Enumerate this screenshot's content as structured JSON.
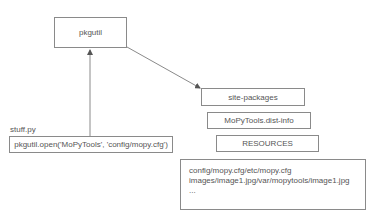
{
  "nodes": {
    "pkgutil": "pkgutil",
    "stuff_label": "stuff.py",
    "stuff_code": "pkgutil.open('MoPyTools', 'config/mopy.cfg')",
    "site_packages": "site-packages",
    "dist_info": "MoPyTools.dist-info",
    "resources": "RESOURCES",
    "resource_map": [
      "config/mopy.cfg/etc/mopy.cfg",
      "images/image1.jpg/var/mopytools/image1.jpg",
      "..."
    ]
  },
  "colors": {
    "line": "#8a8a8a",
    "text": "#555555"
  }
}
